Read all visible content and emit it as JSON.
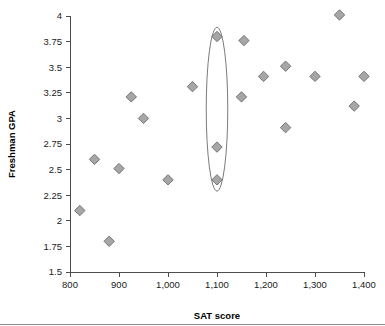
{
  "chart_data": {
    "type": "scatter",
    "title": "",
    "xlabel": "SAT score",
    "ylabel": "Freshman GPA",
    "xlim": [
      800,
      1400
    ],
    "ylim": [
      1.5,
      4
    ],
    "xticks": [
      800,
      900,
      1000,
      1100,
      1200,
      1300,
      1400
    ],
    "xticklabels": [
      "800",
      "900",
      "1,000",
      "1,100",
      "1,200",
      "1,300",
      "1,400"
    ],
    "yticks": [
      1.5,
      1.75,
      2,
      2.25,
      2.5,
      2.75,
      3,
      3.25,
      3.5,
      3.75,
      4
    ],
    "yticklabels": [
      "1.5",
      "1.75",
      "2",
      "2.25",
      "2.5",
      "2.75",
      "3",
      "3.25",
      "3.5",
      "3.75",
      "4"
    ],
    "grid": false,
    "legend": false,
    "marker_shape": "diamond",
    "marker_fill": "#a6a6a6",
    "marker_edge": "#6b6b6b",
    "points": [
      {
        "x": 820,
        "y": 2.1
      },
      {
        "x": 850,
        "y": 2.6
      },
      {
        "x": 880,
        "y": 1.8
      },
      {
        "x": 900,
        "y": 2.51
      },
      {
        "x": 925,
        "y": 3.21
      },
      {
        "x": 950,
        "y": 3.0
      },
      {
        "x": 1000,
        "y": 2.4
      },
      {
        "x": 1050,
        "y": 3.31
      },
      {
        "x": 1100,
        "y": 3.8
      },
      {
        "x": 1100,
        "y": 2.72
      },
      {
        "x": 1100,
        "y": 2.4
      },
      {
        "x": 1150,
        "y": 3.21
      },
      {
        "x": 1155,
        "y": 3.76
      },
      {
        "x": 1195,
        "y": 3.41
      },
      {
        "x": 1240,
        "y": 3.51
      },
      {
        "x": 1240,
        "y": 2.91
      },
      {
        "x": 1300,
        "y": 3.41
      },
      {
        "x": 1350,
        "y": 4.01
      },
      {
        "x": 1380,
        "y": 3.12
      },
      {
        "x": 1400,
        "y": 3.41
      }
    ],
    "annotations": [
      {
        "kind": "ellipse",
        "label": "vertical-outlier-group",
        "center_x": 1100,
        "center_y": 3.09,
        "radius_x": 22,
        "radius_y": 0.8,
        "stroke": "#7a7a7a"
      }
    ]
  }
}
